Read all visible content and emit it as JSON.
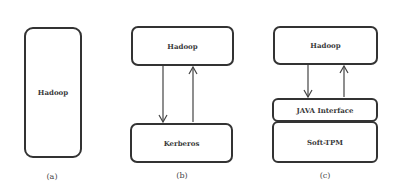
{
  "panels": {
    "a": {
      "caption": "(a)",
      "hadoop_label": "Hadoop"
    },
    "b": {
      "caption": "(b)",
      "hadoop_label": "Hadoop",
      "kerberos_label": "Kerberos"
    },
    "c": {
      "caption": "(c)",
      "hadoop_label": "Hadoop",
      "java_interface_label": "JAVA Interface",
      "soft_tpm_label": "Soft-TPM"
    }
  },
  "colors": {
    "stroke": "#333333",
    "text": "#3a3a3a",
    "background": "#ffffff"
  }
}
